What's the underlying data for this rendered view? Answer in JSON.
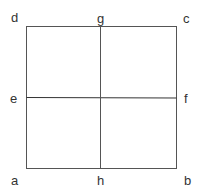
{
  "diagram": {
    "type": "square-divided-into-quadrants",
    "line_color": "#444444",
    "labels": {
      "a": "a",
      "b": "b",
      "c": "c",
      "d": "d",
      "e": "e",
      "f": "f",
      "g": "g",
      "h": "h"
    }
  }
}
